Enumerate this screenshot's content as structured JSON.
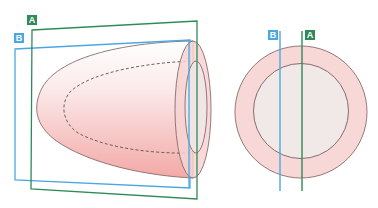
{
  "diagram": {
    "title": "",
    "colors": {
      "plane_a": "#2e8b57",
      "plane_b": "#4aa8e0",
      "tissue_fill": "#f6d3d2",
      "tissue_gradient_start": "#ffffff",
      "tissue_gradient_end": "#f2a9a6",
      "outline": "#8a6b6b",
      "inner_fill": "#efe6e6",
      "dashed": "#555555"
    },
    "labels": {
      "plane_a": "A",
      "plane_b": "B"
    },
    "left_view": {
      "description": "3D bullet/cone-shaped object sectioned by two planes",
      "planes": [
        {
          "id": "A",
          "color": "plane_a",
          "label": "A"
        },
        {
          "id": "B",
          "color": "plane_b",
          "label": "B"
        }
      ]
    },
    "right_view": {
      "description": "Cross-section end view: concentric circles with two section lines",
      "lines": [
        {
          "id": "B",
          "label": "B"
        },
        {
          "id": "A",
          "label": "A"
        }
      ]
    }
  }
}
